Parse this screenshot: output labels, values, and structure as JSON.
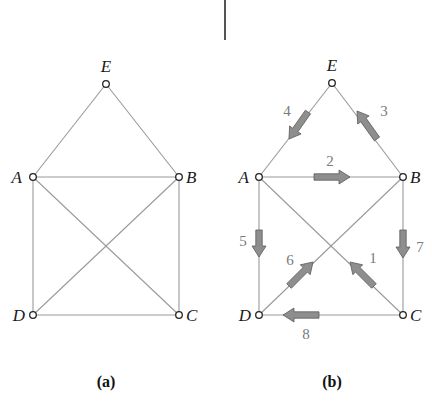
{
  "divider": {
    "x": 225,
    "y1": 0,
    "y2": 40
  },
  "graphs": [
    {
      "id": "a",
      "caption": "(a)",
      "caption_pos": [
        106,
        387
      ],
      "nodes": [
        {
          "name": "E",
          "x": 106,
          "y": 84,
          "lx": 106,
          "ly": 72,
          "anchor": "middle"
        },
        {
          "name": "A",
          "x": 33,
          "y": 177,
          "lx": 22,
          "ly": 183,
          "anchor": "end"
        },
        {
          "name": "B",
          "x": 179,
          "y": 177,
          "lx": 186,
          "ly": 183,
          "anchor": "start"
        },
        {
          "name": "D",
          "x": 33,
          "y": 315,
          "lx": 25,
          "ly": 321,
          "anchor": "end"
        },
        {
          "name": "C",
          "x": 179,
          "y": 315,
          "lx": 186,
          "ly": 321,
          "anchor": "start"
        }
      ],
      "edges": [
        {
          "from": "E",
          "to": "A"
        },
        {
          "from": "E",
          "to": "B"
        },
        {
          "from": "A",
          "to": "B"
        },
        {
          "from": "A",
          "to": "D"
        },
        {
          "from": "B",
          "to": "C"
        },
        {
          "from": "A",
          "to": "C"
        },
        {
          "from": "B",
          "to": "D"
        },
        {
          "from": "D",
          "to": "C"
        }
      ]
    },
    {
      "id": "b",
      "caption": "(b)",
      "caption_pos": [
        332,
        387
      ],
      "nodes": [
        {
          "name": "E",
          "x": 332,
          "y": 83,
          "lx": 332,
          "ly": 71,
          "anchor": "middle"
        },
        {
          "name": "A",
          "x": 259,
          "y": 177,
          "lx": 249,
          "ly": 183,
          "anchor": "end"
        },
        {
          "name": "B",
          "x": 403,
          "y": 177,
          "lx": 410,
          "ly": 183,
          "anchor": "start"
        },
        {
          "name": "D",
          "x": 259,
          "y": 315,
          "lx": 251,
          "ly": 321,
          "anchor": "end"
        },
        {
          "name": "C",
          "x": 403,
          "y": 315,
          "lx": 410,
          "ly": 321,
          "anchor": "start"
        }
      ],
      "edges": [
        {
          "from": "C",
          "to": "A",
          "label": "1",
          "arrow": [
            [
              374,
              286
            ],
            [
              350,
              262
            ]
          ],
          "label_pos": [
            373,
            263
          ]
        },
        {
          "from": "A",
          "to": "B",
          "label": "2",
          "arrow": [
            [
              314,
              177
            ],
            [
              350,
              177
            ]
          ],
          "label_pos": [
            330,
            166
          ]
        },
        {
          "from": "B",
          "to": "E",
          "label": "3",
          "arrow": [
            [
              377,
              139
            ],
            [
              357,
              111
            ]
          ],
          "label_pos": [
            384,
            116
          ]
        },
        {
          "from": "E",
          "to": "A",
          "label": "4",
          "arrow": [
            [
              308,
              112
            ],
            [
              289,
              139
            ]
          ],
          "label_pos": [
            287,
            116
          ]
        },
        {
          "from": "A",
          "to": "D",
          "label": "5",
          "arrow": [
            [
              259,
              230
            ],
            [
              259,
              257
            ]
          ],
          "label_pos": [
            243,
            246
          ]
        },
        {
          "from": "D",
          "to": "B",
          "label": "6",
          "arrow": [
            [
              289,
              286
            ],
            [
              313,
              262
            ]
          ],
          "label_pos": [
            290,
            265
          ]
        },
        {
          "from": "B",
          "to": "C",
          "label": "7",
          "arrow": [
            [
              403,
              230
            ],
            [
              403,
              258
            ]
          ],
          "label_pos": [
            420,
            252
          ]
        },
        {
          "from": "C",
          "to": "D",
          "label": "8",
          "arrow": [
            [
              319,
              315
            ],
            [
              283,
              315
            ]
          ],
          "label_pos": [
            306,
            339
          ]
        }
      ]
    }
  ]
}
